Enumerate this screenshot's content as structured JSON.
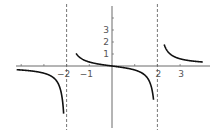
{
  "chart_data": {
    "type": "line",
    "title": "",
    "function": "f(x) = x / (x^2 - 4)",
    "xlabel": "",
    "ylabel": "",
    "xlim": [
      -4.2,
      4.0
    ],
    "ylim": [
      -5.8,
      5.6
    ],
    "x_ticks": [
      -4,
      -3,
      -2,
      -1,
      1,
      2,
      3
    ],
    "x_tick_labels": [
      {
        "value": -2,
        "label": "−2"
      },
      {
        "value": -1,
        "label": "−1"
      },
      {
        "value": 2,
        "label": "2"
      },
      {
        "value": 3,
        "label": "3"
      }
    ],
    "y_ticks": [
      1,
      2,
      3,
      4
    ],
    "y_tick_labels": [
      {
        "value": 1,
        "label": "1"
      },
      {
        "value": 2,
        "label": "2"
      },
      {
        "value": 3,
        "label": "3"
      }
    ],
    "asymptotes": {
      "vertical": [
        -2,
        2
      ],
      "horizontal": [
        0
      ]
    },
    "series": [
      {
        "name": "left branch",
        "x": [
          -4.2,
          -3.5,
          -3,
          -2.5,
          -2.2,
          -2.1
        ],
        "y": [
          -0.31,
          -0.42,
          -0.6,
          -1.11,
          -2.62,
          -5.12
        ]
      },
      {
        "name": "middle branch",
        "x": [
          -1.6,
          -1.5,
          -1,
          -0.5,
          0,
          0.5,
          1,
          1.5,
          1.8
        ],
        "y": [
          1.11,
          0.86,
          0.33,
          0.13,
          0,
          -0.13,
          -0.33,
          -0.86,
          -2.37
        ]
      },
      {
        "name": "right branch",
        "x": [
          2.35,
          2.5,
          3,
          3.5,
          4.0
        ],
        "y": [
          1.54,
          1.11,
          0.6,
          0.42,
          0.33
        ]
      }
    ],
    "grid": false,
    "legend": null
  }
}
